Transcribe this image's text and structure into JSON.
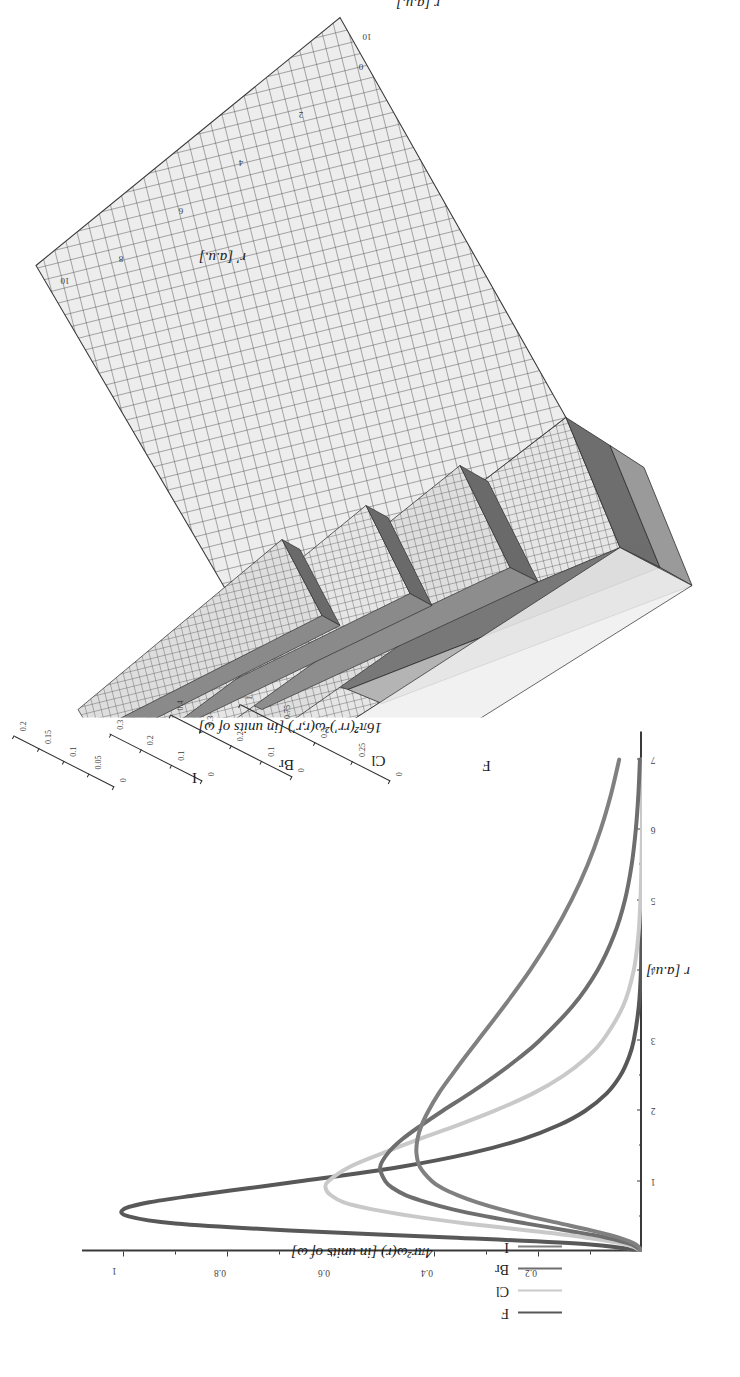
{
  "figure": {
    "type": "scientific-figure"
  },
  "panel3d": {
    "zlabel": "16π̂²(rr')²ω(r,r') [in units of ω]",
    "axis_rp_label": "r' [a.u.]",
    "axis_r_label": "r [a.u.]",
    "rp_ticks": [
      "0",
      "2",
      "4",
      "6",
      "8",
      "10"
    ],
    "r_ticks": [
      "0",
      "2",
      "4",
      "6",
      "8",
      "10"
    ],
    "surfaces": [
      {
        "name": "F",
        "zticks": [
          "0",
          "0.25",
          "0.5",
          "0.75",
          "1"
        ]
      },
      {
        "name": "Cl",
        "zticks": [
          "0",
          "0.1",
          "0.2",
          "0.3",
          "0.4"
        ]
      },
      {
        "name": "Br",
        "zticks": [
          "0",
          "0.1",
          "0.2",
          "0.3"
        ]
      },
      {
        "name": "I",
        "zticks": [
          "0",
          "0.05",
          "0.1",
          "0.15",
          "0.2"
        ]
      }
    ]
  },
  "panel2d": {
    "ylabel": "4πr²ω(r) [in units of ω]",
    "xlabel": "r [a.u.]",
    "yticks": [
      "0.2",
      "0.4",
      "0.6",
      "0.8",
      "1"
    ],
    "xticks": [
      "1",
      "2",
      "3",
      "4",
      "5",
      "6",
      "7"
    ],
    "legend": [
      {
        "label": "F",
        "color": "#585858"
      },
      {
        "label": "Cl",
        "color": "#c9c9c9"
      },
      {
        "label": "Br",
        "color": "#6e6e6e"
      },
      {
        "label": "I",
        "color": "#808080"
      }
    ]
  },
  "chart_data": {
    "type": "line",
    "title": "",
    "xlabel": "r [a.u.]",
    "ylabel": "4πr²ω(r) [in units of ω]",
    "xlim": [
      0,
      7.4
    ],
    "ylim": [
      0,
      1.08
    ],
    "grid": false,
    "legend_position": "upper-left",
    "x": [
      0,
      0.1,
      0.2,
      0.3,
      0.4,
      0.5,
      0.6,
      0.7,
      0.8,
      0.9,
      1.0,
      1.2,
      1.4,
      1.6,
      1.8,
      2.0,
      2.25,
      2.5,
      2.75,
      3.0,
      3.5,
      4.0,
      4.5,
      5.0,
      5.5,
      6.0,
      6.5,
      7.0
    ],
    "series": [
      {
        "name": "F",
        "color": "#585858",
        "values": [
          0,
          0.1,
          0.37,
          0.68,
          0.9,
          0.99,
          1.0,
          0.95,
          0.86,
          0.76,
          0.66,
          0.47,
          0.33,
          0.23,
          0.16,
          0.11,
          0.068,
          0.042,
          0.026,
          0.016,
          0.006,
          0.002,
          0.001,
          0.0,
          0.0,
          0.0,
          0.0,
          0.0
        ]
      },
      {
        "name": "Cl",
        "color": "#c9c9c9",
        "values": [
          0,
          0.03,
          0.11,
          0.22,
          0.34,
          0.44,
          0.52,
          0.575,
          0.6,
          0.61,
          0.605,
          0.565,
          0.5,
          0.43,
          0.355,
          0.285,
          0.21,
          0.152,
          0.108,
          0.076,
          0.036,
          0.016,
          0.007,
          0.003,
          0.001,
          0.0,
          0.0,
          0.0
        ]
      },
      {
        "name": "Br",
        "color": "#6e6e6e",
        "values": [
          0,
          0.02,
          0.07,
          0.145,
          0.225,
          0.3,
          0.365,
          0.415,
          0.455,
          0.48,
          0.495,
          0.505,
          0.49,
          0.462,
          0.425,
          0.385,
          0.332,
          0.283,
          0.238,
          0.198,
          0.133,
          0.086,
          0.054,
          0.033,
          0.02,
          0.012,
          0.007,
          0.004
        ]
      },
      {
        "name": "I",
        "color": "#808080",
        "values": [
          0,
          0.012,
          0.046,
          0.098,
          0.158,
          0.218,
          0.272,
          0.318,
          0.355,
          0.385,
          0.405,
          0.428,
          0.435,
          0.433,
          0.425,
          0.412,
          0.392,
          0.368,
          0.343,
          0.317,
          0.265,
          0.216,
          0.173,
          0.136,
          0.105,
          0.08,
          0.06,
          0.044
        ]
      }
    ]
  }
}
